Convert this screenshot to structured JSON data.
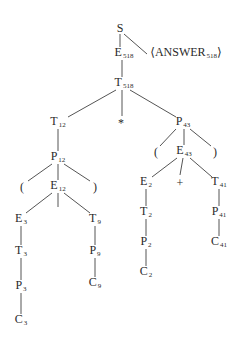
{
  "diagram": {
    "type": "parse-tree",
    "nodes": [
      {
        "id": "S",
        "sym": "S",
        "sub": "",
        "x": 120,
        "y": 28
      },
      {
        "id": "E518",
        "sym": "E",
        "sub": "518",
        "x": 124,
        "y": 54
      },
      {
        "id": "ANS",
        "sym": "⟨ANSWER",
        "sub": "518",
        "tail": "⟩",
        "x": 186,
        "y": 54
      },
      {
        "id": "T518",
        "sym": "T",
        "sub": "518",
        "x": 124,
        "y": 84
      },
      {
        "id": "T12",
        "sym": "T",
        "sub": "12",
        "x": 58,
        "y": 123
      },
      {
        "id": "STAR",
        "sym": "*",
        "sub": "",
        "x": 121,
        "y": 123
      },
      {
        "id": "P43",
        "sym": "P",
        "sub": "43",
        "x": 183,
        "y": 123
      },
      {
        "id": "P12",
        "sym": "P",
        "sub": "12",
        "x": 58,
        "y": 158
      },
      {
        "id": "LP43",
        "sym": "(",
        "sub": "",
        "x": 156,
        "y": 152
      },
      {
        "id": "E43",
        "sym": "E",
        "sub": "43",
        "x": 184,
        "y": 152
      },
      {
        "id": "RP43",
        "sym": ")",
        "sub": "",
        "x": 215,
        "y": 152
      },
      {
        "id": "LP12",
        "sym": "(",
        "sub": "",
        "x": 22,
        "y": 187
      },
      {
        "id": "E12",
        "sym": "E",
        "sub": "12",
        "x": 58,
        "y": 187
      },
      {
        "id": "RP12",
        "sym": ")",
        "sub": "",
        "x": 95,
        "y": 187
      },
      {
        "id": "E2",
        "sym": "E",
        "sub": "2",
        "x": 146,
        "y": 183
      },
      {
        "id": "PLUS",
        "sym": "+",
        "sub": "",
        "x": 180,
        "y": 183
      },
      {
        "id": "T41",
        "sym": "T",
        "sub": "41",
        "x": 219,
        "y": 183
      },
      {
        "id": "E3",
        "sym": "E",
        "sub": "3",
        "x": 21,
        "y": 220
      },
      {
        "id": "T9",
        "sym": "T",
        "sub": "9",
        "x": 95,
        "y": 220
      },
      {
        "id": "T2",
        "sym": "T",
        "sub": "2",
        "x": 146,
        "y": 213
      },
      {
        "id": "P41",
        "sym": "P",
        "sub": "41",
        "x": 219,
        "y": 213
      },
      {
        "id": "T3",
        "sym": "T",
        "sub": "3",
        "x": 21,
        "y": 252
      },
      {
        "id": "P9",
        "sym": "P",
        "sub": "9",
        "x": 95,
        "y": 252
      },
      {
        "id": "P2",
        "sym": "P",
        "sub": "2",
        "x": 146,
        "y": 243
      },
      {
        "id": "C41",
        "sym": "C",
        "sub": "41",
        "x": 219,
        "y": 243
      },
      {
        "id": "P3",
        "sym": "P",
        "sub": "3",
        "x": 21,
        "y": 287
      },
      {
        "id": "C9",
        "sym": "C",
        "sub": "9",
        "x": 95,
        "y": 284
      },
      {
        "id": "C2",
        "sym": "C",
        "sub": "2",
        "x": 146,
        "y": 273
      },
      {
        "id": "C3",
        "sym": "C",
        "sub": "3",
        "x": 21,
        "y": 321
      }
    ],
    "edges": [
      [
        120,
        34,
        120,
        47
      ],
      [
        124,
        34,
        147,
        54
      ],
      [
        122,
        60,
        122,
        77
      ],
      [
        116,
        90,
        68,
        117
      ],
      [
        122,
        90,
        122,
        116
      ],
      [
        130,
        90,
        176,
        117
      ],
      [
        58,
        129,
        58,
        151
      ],
      [
        176,
        129,
        160,
        146
      ],
      [
        184,
        129,
        184,
        145
      ],
      [
        190,
        129,
        211,
        146
      ],
      [
        52,
        164,
        28,
        181
      ],
      [
        58,
        164,
        58,
        180
      ],
      [
        64,
        164,
        90,
        181
      ],
      [
        177,
        158,
        152,
        177
      ],
      [
        183,
        158,
        180,
        175
      ],
      [
        190,
        158,
        212,
        177
      ],
      [
        52,
        193,
        26,
        213
      ],
      [
        58,
        193,
        58,
        207
      ],
      [
        64,
        193,
        90,
        213
      ],
      [
        146,
        189,
        146,
        206
      ],
      [
        219,
        189,
        219,
        206
      ],
      [
        21,
        226,
        21,
        245
      ],
      [
        95,
        226,
        95,
        245
      ],
      [
        146,
        219,
        146,
        236
      ],
      [
        219,
        219,
        219,
        236
      ],
      [
        21,
        258,
        21,
        280
      ],
      [
        95,
        258,
        95,
        277
      ],
      [
        146,
        249,
        146,
        266
      ],
      [
        21,
        293,
        21,
        314
      ]
    ]
  }
}
